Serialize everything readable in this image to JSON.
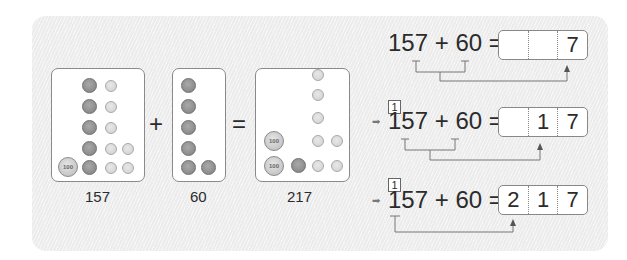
{
  "left": {
    "addend1": {
      "value": "157",
      "hundreds": 1,
      "tens": 5,
      "ones": 7
    },
    "plus": "+",
    "addend2": {
      "value": "60",
      "hundreds": 0,
      "tens": 6,
      "ones": 0
    },
    "equals": "=",
    "sum": {
      "value": "217",
      "hundreds": 2,
      "tens": 1,
      "ones": 7
    },
    "coin_labels": {
      "c100": "100",
      "c10": "10",
      "c1": "1"
    }
  },
  "steps": [
    {
      "expression": "157 + 60 =",
      "carry": "",
      "arrow": "",
      "cells": [
        "",
        "",
        "7"
      ]
    },
    {
      "expression": "157 + 60 =",
      "carry": "1",
      "arrow": "➡",
      "cells": [
        "",
        "1",
        "7"
      ]
    },
    {
      "expression": "157 + 60 =",
      "carry": "1",
      "arrow": "➡",
      "cells": [
        "2",
        "1",
        "7"
      ]
    }
  ],
  "colors": {
    "panel": "#ececec",
    "ink": "#2b2b2b",
    "box_border": "#8a8a8a"
  }
}
